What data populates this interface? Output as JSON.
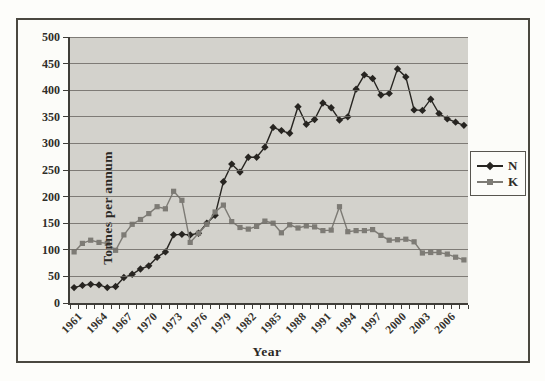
{
  "chart_data": {
    "type": "line",
    "title": "",
    "xlabel": "Year",
    "ylabel": "Tonnes per annum",
    "ylim": [
      0,
      500
    ],
    "ytick_step": 50,
    "yticks": [
      0,
      50,
      100,
      150,
      200,
      250,
      300,
      350,
      400,
      450,
      500
    ],
    "grid": true,
    "legend_position": "right",
    "x_years": [
      1961,
      1962,
      1963,
      1964,
      1965,
      1966,
      1967,
      1968,
      1969,
      1970,
      1971,
      1972,
      1973,
      1974,
      1975,
      1976,
      1977,
      1978,
      1979,
      1980,
      1981,
      1982,
      1983,
      1984,
      1985,
      1986,
      1987,
      1988,
      1989,
      1990,
      1991,
      1992,
      1993,
      1994,
      1995,
      1996,
      1997,
      1998,
      1999,
      2000,
      2001,
      2002,
      2003,
      2004,
      2005,
      2006,
      2007,
      2008
    ],
    "xtick_labels": [
      "1961",
      "1964",
      "1967",
      "1970",
      "1973",
      "1976",
      "1979",
      "1982",
      "1985",
      "1988",
      "1991",
      "1994",
      "1997",
      "2000",
      "2003",
      "2006"
    ],
    "series": [
      {
        "name": "N",
        "marker": "diamond",
        "color": "#272521",
        "values": [
          29,
          33,
          35,
          34,
          29,
          31,
          48,
          54,
          64,
          70,
          86,
          96,
          128,
          129,
          128,
          131,
          150,
          165,
          228,
          261,
          246,
          274,
          274,
          293,
          330,
          324,
          319,
          369,
          336,
          345,
          376,
          367,
          344,
          350,
          402,
          429,
          422,
          391,
          394,
          440,
          425,
          363,
          362,
          383,
          356,
          346,
          340,
          334
        ]
      },
      {
        "name": "K",
        "marker": "square",
        "color": "#7d7b75",
        "values": [
          96,
          112,
          118,
          114,
          112,
          99,
          128,
          148,
          157,
          168,
          181,
          177,
          210,
          193,
          114,
          131,
          148,
          171,
          184,
          153,
          142,
          139,
          144,
          154,
          150,
          132,
          147,
          141,
          145,
          143,
          136,
          137,
          181,
          134,
          136,
          136,
          138,
          127,
          118,
          119,
          120,
          115,
          94,
          95,
          95,
          92,
          86,
          81
        ]
      }
    ],
    "colors": {
      "plot_background": "#d3d2cc",
      "gridline": "#6e6c66",
      "axis": "#3f3d38",
      "figure_border": "#4a4840"
    }
  },
  "legend": {
    "items": [
      {
        "label": "N"
      },
      {
        "label": "K"
      }
    ]
  }
}
